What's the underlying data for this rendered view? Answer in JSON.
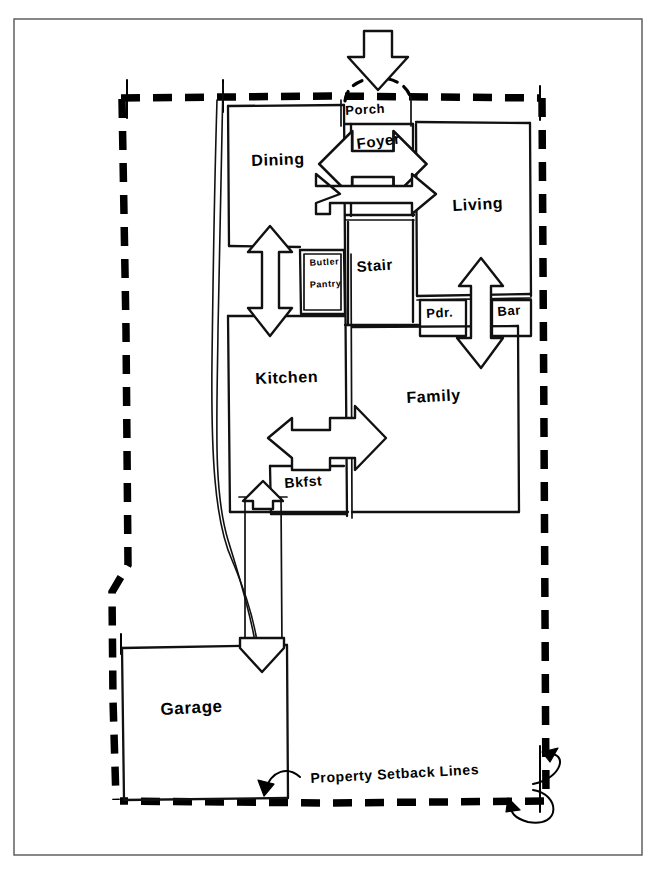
{
  "sheet": {
    "title": "First Floor Bubble / Relationship Plan Sketch",
    "ink_color": "#111111",
    "paper_color": "#ffffff",
    "border_color": "#555555"
  },
  "rooms": [
    {
      "key": "porch",
      "label": "Porch",
      "x": 341,
      "y": 105,
      "w": 70,
      "h": 20
    },
    {
      "key": "foyer",
      "label": "Foyer",
      "x": 351,
      "y": 132,
      "w": 62,
      "h": 82
    },
    {
      "key": "dining",
      "label": "Dining",
      "x": 228,
      "y": 105,
      "w": 116,
      "h": 115
    },
    {
      "key": "living",
      "label": "Living",
      "x": 416,
      "y": 122,
      "w": 108,
      "h": 180
    },
    {
      "key": "stair",
      "label": "Stair",
      "x": 351,
      "y": 222,
      "w": 62,
      "h": 100
    },
    {
      "key": "butler-pantry",
      "label": "Butler Pantry",
      "line1": "Butler",
      "line2": "Pantry",
      "x": 300,
      "y": 252,
      "w": 44,
      "h": 62
    },
    {
      "key": "powder",
      "label": "Pdr.",
      "x": 421,
      "y": 293,
      "w": 44,
      "h": 40
    },
    {
      "key": "bar",
      "label": "Bar",
      "x": 492,
      "y": 293,
      "w": 38,
      "h": 40
    },
    {
      "key": "kitchen",
      "label": "Kitchen",
      "x": 228,
      "y": 315,
      "w": 116,
      "h": 200
    },
    {
      "key": "family",
      "label": "Family",
      "x": 351,
      "y": 320,
      "w": 165,
      "h": 190
    },
    {
      "key": "breakfast",
      "label": "Bkfst",
      "x": 272,
      "y": 463,
      "w": 72,
      "h": 52
    },
    {
      "key": "garage",
      "label": "Garage",
      "x": 120,
      "y": 645,
      "w": 165,
      "h": 155
    }
  ],
  "annotations": [
    {
      "key": "property-setback-lines",
      "label": "Property Setback Lines",
      "x": 310,
      "y": 778
    }
  ],
  "relationship_arrows": [
    {
      "key": "entry-approach-arrow",
      "direction": "down",
      "from": "street",
      "to": "porch"
    },
    {
      "key": "dining-foyer-living-arrow",
      "direction": "bidirectional-horizontal",
      "from": "dining",
      "to": "living"
    },
    {
      "key": "dining-kitchen-arrow",
      "direction": "bidirectional-vertical",
      "from": "dining",
      "to": "kitchen"
    },
    {
      "key": "living-family-arrow",
      "direction": "bidirectional-vertical",
      "from": "living",
      "to": "family"
    },
    {
      "key": "kitchen-family-arrow",
      "direction": "bidirectional-horizontal",
      "from": "kitchen",
      "to": "family"
    },
    {
      "key": "breakfast-garage-arrow",
      "direction": "bidirectional-vertical",
      "from": "breakfast",
      "to": "garage"
    }
  ],
  "legend": {
    "setback_style": "heavy dashed line",
    "porch_entry_style": "dashed arc"
  }
}
